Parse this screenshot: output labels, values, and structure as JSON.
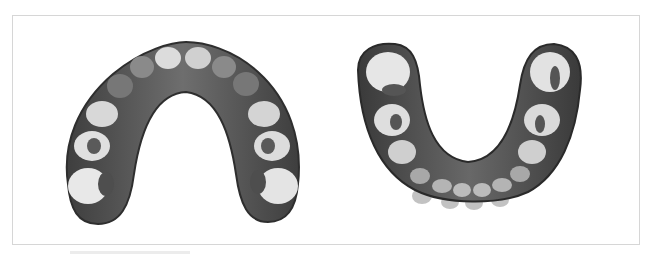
{
  "figure": {
    "panels": [
      {
        "id": "upper",
        "subject": "maxillary dental arch (occlusal view)",
        "orientation": "opening-down"
      },
      {
        "id": "lower",
        "subject": "mandibular dental arch (occlusal view)",
        "orientation": "opening-up"
      }
    ],
    "colors": {
      "frame_border": "#d6d6d6",
      "gum_dark": "#4a4a4a",
      "gum_mid": "#6b6b6b",
      "tooth_light": "#e4e4e4",
      "tooth_shadow": "#555555",
      "background": "#ffffff"
    }
  }
}
